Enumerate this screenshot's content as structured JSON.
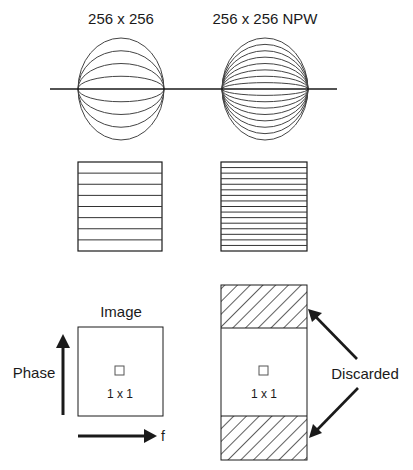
{
  "titles": {
    "left": "256 x 256",
    "right": "256 x 256 NPW"
  },
  "spheres": {
    "left": {
      "arcs_per_half": 4
    },
    "right": {
      "arcs_per_half": 8
    }
  },
  "slabs": {
    "left": {
      "bands": 8
    },
    "right": {
      "bands": 16
    }
  },
  "image_panel": {
    "title": "Image",
    "voxel_label": "1 x 1",
    "phase_axis_label": "Phase",
    "freq_axis_label": "f"
  },
  "npw_panel": {
    "voxel_label": "1 x 1",
    "discarded_label": "Discarded"
  },
  "colors": {
    "stroke": "#1a1a1a",
    "thin_stroke": "#444444",
    "background": "#ffffff"
  }
}
